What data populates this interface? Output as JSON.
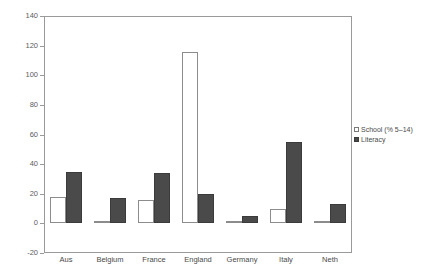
{
  "chart_data": {
    "type": "bar",
    "title": "",
    "xlabel": "",
    "ylabel": "",
    "ylim": [
      -20,
      140
    ],
    "ytick_step": 20,
    "yticks": [
      140,
      120,
      100,
      80,
      60,
      40,
      20,
      0,
      -20
    ],
    "ytick_labels": [
      "140",
      "120",
      "100",
      "80",
      "60",
      "40",
      "20",
      "0",
      "-20"
    ],
    "grid": false,
    "legend_position": "right",
    "categories": [
      "Aus",
      "Belgium",
      "France",
      "England",
      "Germany",
      "Italy",
      "Neth"
    ],
    "series": [
      {
        "name": "School (% 5–14)",
        "color": "#ffffff",
        "edge_color": "#8c8c8c",
        "values": [
          18,
          1,
          16,
          116,
          1,
          10,
          1
        ]
      },
      {
        "name": "Literacy",
        "color": "#4a4a4a",
        "edge_color": "#3b3b3b",
        "values": [
          35,
          17,
          34,
          20,
          5,
          55,
          13
        ]
      }
    ]
  },
  "legend": {
    "entries": [
      {
        "label": "School (% 5–14)",
        "marker": "open-square-marker"
      },
      {
        "label": "Literacy",
        "marker": "filled-square-marker"
      }
    ]
  }
}
